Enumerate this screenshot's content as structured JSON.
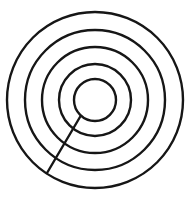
{
  "figure": {
    "background_color": "#ffffff",
    "stroke_color": "#161616",
    "stroke_width": 2.4,
    "canvas": {
      "width": 190,
      "height": 203
    },
    "center": {
      "x": 95,
      "y": 100
    },
    "ring_count": 5,
    "rings": [
      {
        "index": 1,
        "name": "outermost-ring",
        "radius": 88
      },
      {
        "index": 2,
        "name": "ring-2",
        "radius": 70
      },
      {
        "index": 3,
        "name": "ring-3",
        "radius": 53
      },
      {
        "index": 4,
        "name": "ring-4",
        "radius": 36
      },
      {
        "index": 5,
        "name": "innermost-ring",
        "radius": 21
      }
    ],
    "radial_line": {
      "name": "radial-cut-line",
      "description": "Straight segment from innermost circle edge outward toward lower-left, terminating at ring 4",
      "start": {
        "x": 80,
        "y": 117
      },
      "end": {
        "x": 47,
        "y": 173
      },
      "crosses_rings": [
        4,
        3
      ],
      "reaches_outermost": false
    }
  },
  "chart_data": {
    "type": "scatter",
    "xlabel": "",
    "ylabel": "",
    "xlim": [
      0,
      190
    ],
    "ylim": [
      0,
      203
    ],
    "grid": false,
    "legend": "none",
    "center": [
      95,
      100
    ],
    "categories": [
      "outermost-ring",
      "ring-2",
      "ring-3",
      "ring-4",
      "innermost-ring"
    ],
    "values": [
      88,
      70,
      53,
      36,
      21
    ],
    "annotations": [
      "radial line from (80,117) to (47,173)"
    ]
  }
}
